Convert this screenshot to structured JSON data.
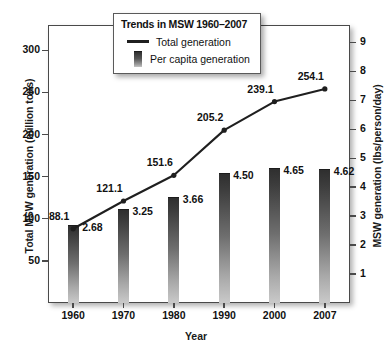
{
  "chart_data": {
    "type": "bar",
    "title": "Trends in MSW 1960–2007",
    "xlabel": "Year",
    "ylabel": "Total MSW generation (million tons)",
    "ylabel_right": "MSW generation (lbs/person/day)",
    "categories": [
      "1960",
      "1970",
      "1980",
      "1990",
      "2000",
      "2007"
    ],
    "ylim": [
      0,
      330
    ],
    "yticks": [
      "300",
      "250",
      "200",
      "150",
      "100",
      "50"
    ],
    "ylim_right": [
      0,
      9.6
    ],
    "yticks_right": [
      "9",
      "8",
      "7",
      "6",
      "5",
      "4",
      "3",
      "2",
      "1"
    ],
    "grid": false,
    "legend_position": "top-center",
    "series": [
      {
        "name": "Total generation",
        "type": "line",
        "axis": "left",
        "unit": "million tons",
        "values": [
          88.1,
          121.1,
          151.6,
          205.2,
          239.1,
          254.1
        ],
        "labels": [
          "88.1",
          "121.1",
          "151.6",
          "205.2",
          "239.1",
          "254.1"
        ]
      },
      {
        "name": "Per capita generation",
        "type": "bar",
        "axis": "right",
        "unit": "lbs/person/day",
        "values": [
          2.68,
          3.25,
          3.66,
          4.5,
          4.65,
          4.62
        ],
        "labels": [
          "2.68",
          "3.25",
          "3.66",
          "4.50",
          "4.65",
          "4.62"
        ]
      }
    ],
    "colors": {
      "line": "#1f1f1f",
      "bar_top": "#2f2f2f",
      "bar_bottom": "#c9c9c9",
      "frame": "#4a4a4a",
      "text": "#111111",
      "background": "#ffffff"
    }
  }
}
